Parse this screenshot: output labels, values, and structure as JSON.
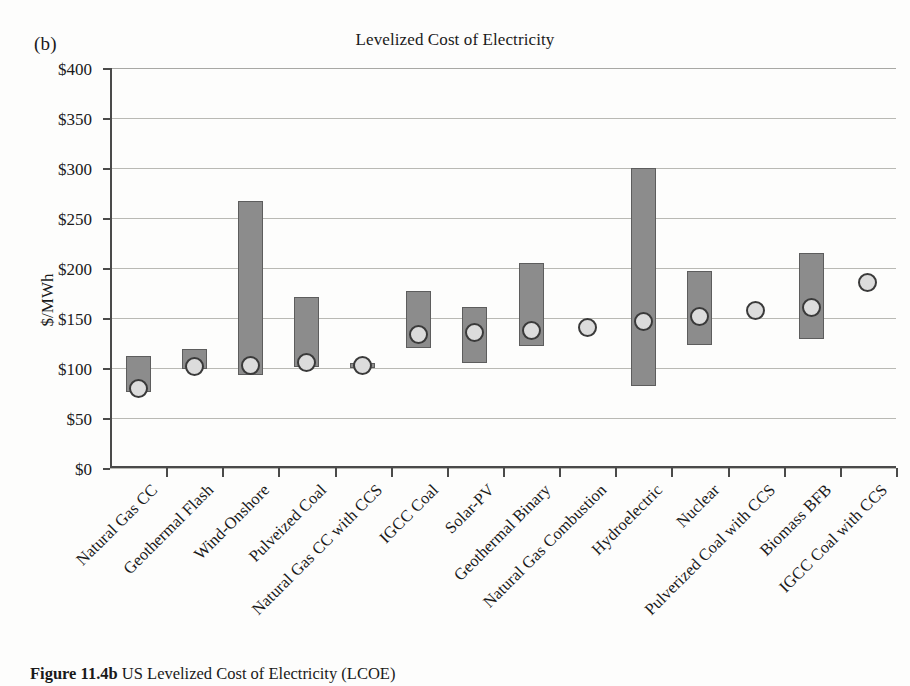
{
  "panel_label": "(b)",
  "caption_bold": "Figure 11.4b",
  "caption_rest": " US Levelized Cost of Electricity (LCOE)",
  "colors": {
    "bar_fill": "#8c8c8c",
    "bar_stroke": "#5d5d5d",
    "marker_fill": "#dcdcdc",
    "marker_stroke": "#3a3a3a",
    "gridline": "#b9b9b4",
    "axis": "#4a4a4a",
    "background": "#fdfdfc"
  },
  "chart_data": {
    "type": "bar",
    "title": "Levelized Cost of Electricity",
    "xlabel": "",
    "ylabel": "$/MWh",
    "ylim": [
      0,
      400
    ],
    "ytick_values": [
      0,
      50,
      100,
      150,
      200,
      250,
      300,
      350,
      400
    ],
    "ytick_labels": [
      "$0",
      "$50",
      "$100",
      "$150",
      "$200",
      "$250",
      "$300",
      "$350",
      "$400"
    ],
    "grid": true,
    "legend": "none",
    "note": "Floating range bars show low-to-high LCOE estimate; circular marker shows the central/average estimate.",
    "categories": [
      "Natural Gas CC",
      "Geothermal Flash",
      "Wind-Onshore",
      "Pulveized Coal",
      "Natural Gas CC with CCS",
      "IGCC Coal",
      "Solar-PV",
      "Geothermal Binary",
      "Natural Gas Combustion",
      "Hydroelectric",
      "Nuclear",
      "Pulverized Coal with CCS",
      "Biomass BFB",
      "IGCC Coal with CCS"
    ],
    "series": [
      {
        "name": "Range low",
        "values": [
          76,
          99,
          93,
          101,
          100,
          120,
          105,
          122,
          140,
          82,
          123,
          157,
          129,
          185
        ]
      },
      {
        "name": "Range high",
        "values": [
          112,
          119,
          267,
          171,
          105,
          177,
          161,
          205,
          142,
          300,
          197,
          159,
          215,
          187
        ]
      },
      {
        "name": "Average",
        "values": [
          80,
          102,
          103,
          106,
          103,
          134,
          136,
          138,
          141,
          147,
          152,
          158,
          161,
          186
        ]
      }
    ]
  }
}
